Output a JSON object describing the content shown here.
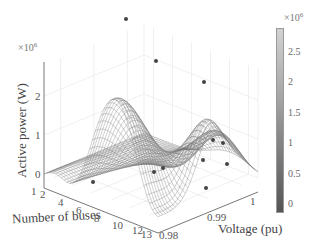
{
  "chart_data": {
    "type": "surface3d",
    "title": "",
    "xlabel": "Number of buses",
    "ylabel": "Voltage (pu)",
    "zlabel": "Active power (W)",
    "z_exponent": "×10^6",
    "x_ticks": [
      "1",
      "2",
      "4",
      "6",
      "8",
      "10",
      "12",
      "13"
    ],
    "y_ticks": [
      "0.98",
      "0.99",
      "1"
    ],
    "z_ticks": [
      "0",
      "1",
      "2"
    ],
    "xlim": [
      1,
      13
    ],
    "ylim": [
      0.975,
      1.005
    ],
    "zlim": [
      0,
      2800000.0
    ],
    "colorbar": {
      "ticks": [
        "0",
        "0.5",
        "1",
        "1.5",
        "2",
        "2.5"
      ],
      "exponent": "×10^6",
      "range": [
        0,
        2800000.0
      ],
      "colormap": "gray"
    },
    "surface_description": "Wireframe mesh surface; tall ridge peaking near ~2.7e6 W at low bus counts / low voltage, secondary peak ~1.8e6 W at high bus counts, valley in between; minimum near 0",
    "highlighted_points": [
      {
        "px": [
          126,
          19
        ]
      },
      {
        "px": [
          156,
          61
        ]
      },
      {
        "px": [
          204,
          82
        ]
      },
      {
        "px": [
          213,
          140
        ]
      },
      {
        "px": [
          223,
          143
        ]
      },
      {
        "px": [
          203,
          160
        ]
      },
      {
        "px": [
          227,
          164
        ]
      },
      {
        "px": [
          93,
          182
        ]
      },
      {
        "px": [
          154,
          172
        ]
      },
      {
        "px": [
          163,
          168
        ]
      },
      {
        "px": [
          206,
          188
        ]
      }
    ],
    "grid": true
  },
  "labels": {
    "zlabel": "Active power (W)",
    "xlabel": "Number of buses",
    "ylabel": "Voltage (pu)",
    "z_exponent_base": "×10",
    "z_exponent_power": "6",
    "cb_exponent_base": "×10",
    "cb_exponent_power": "6"
  }
}
